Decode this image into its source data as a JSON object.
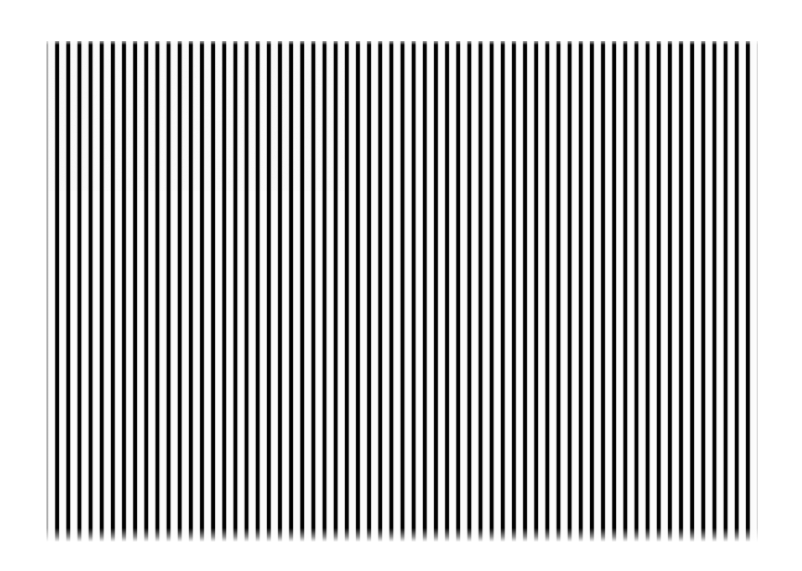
{
  "image": {
    "title": "Vertical Stripe Pattern",
    "description": "High-contrast black and white vertical stripe (square-wave grating) test pattern on a white background",
    "subject": "stripe-grating",
    "canvas": {
      "width": 802,
      "height": 571,
      "background_color": "#ffffff"
    }
  },
  "pattern": {
    "orientation": "vertical",
    "region": {
      "left": 46,
      "top": 41,
      "width": 712,
      "height": 501,
      "right": 758,
      "bottom": 542
    },
    "stripe_count": 64,
    "period_px": 11.15,
    "bar_color": "#000000",
    "gap_color": "#fbfbfb",
    "duty_cycle_percent": 42,
    "edge_softness": "blurred",
    "grain_opacity": 0.055,
    "stops": {
      "bar_center_percent": 0,
      "bar_half_width_percent": 12,
      "blur_edge_percent": 23,
      "gap_start_percent": 33,
      "gap_end_percent": 67,
      "blur_edge2_percent": 77,
      "bar_start_percent": 88
    },
    "fades": {
      "top_px": 4,
      "bottom_px": 14,
      "left_px": 5,
      "right_px": 6
    }
  },
  "chart_data": {
    "type": "bar",
    "xlabel": "",
    "ylabel": "",
    "categories": [
      "1",
      "2",
      "3",
      "4",
      "5",
      "6",
      "7",
      "8",
      "9",
      "10",
      "11",
      "12",
      "13",
      "14",
      "15",
      "16",
      "17",
      "18",
      "19",
      "20",
      "21",
      "22",
      "23",
      "24",
      "25",
      "26",
      "27",
      "28",
      "29",
      "30",
      "31",
      "32",
      "33",
      "34",
      "35",
      "36",
      "37",
      "38",
      "39",
      "40",
      "41",
      "42",
      "43",
      "44",
      "45",
      "46",
      "47",
      "48",
      "49",
      "50",
      "51",
      "52",
      "53",
      "54",
      "55",
      "56",
      "57",
      "58",
      "59",
      "60",
      "61",
      "62",
      "63",
      "64"
    ],
    "values": [
      100,
      100,
      100,
      100,
      100,
      100,
      100,
      100,
      100,
      100,
      100,
      100,
      100,
      100,
      100,
      100,
      100,
      100,
      100,
      100,
      100,
      100,
      100,
      100,
      100,
      100,
      100,
      100,
      100,
      100,
      100,
      100,
      100,
      100,
      100,
      100,
      100,
      100,
      100,
      100,
      100,
      100,
      100,
      100,
      100,
      100,
      100,
      100,
      100,
      100,
      100,
      100,
      100,
      100,
      100,
      100,
      100,
      100,
      100,
      100,
      100,
      100,
      100,
      100
    ],
    "ylim": [
      0,
      100
    ],
    "grid": false,
    "legend": "none"
  }
}
